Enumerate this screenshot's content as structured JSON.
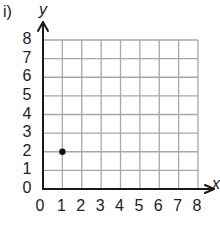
{
  "problem_label": "i)",
  "chart_data": {
    "type": "scatter",
    "title": "",
    "xlabel": "x",
    "ylabel": "y",
    "xlim": [
      0,
      8
    ],
    "ylim": [
      0,
      8
    ],
    "grid": true,
    "x_ticks": [
      "0",
      "1",
      "2",
      "3",
      "4",
      "5",
      "6",
      "7",
      "8"
    ],
    "y_ticks": [
      "0",
      "1",
      "2",
      "3",
      "4",
      "5",
      "6",
      "7",
      "8"
    ],
    "points": [
      {
        "x": 1,
        "y": 2
      }
    ],
    "colors": {
      "grid": "#a8a8a8",
      "axis": "#1a1a1a",
      "point": "#111111"
    }
  }
}
